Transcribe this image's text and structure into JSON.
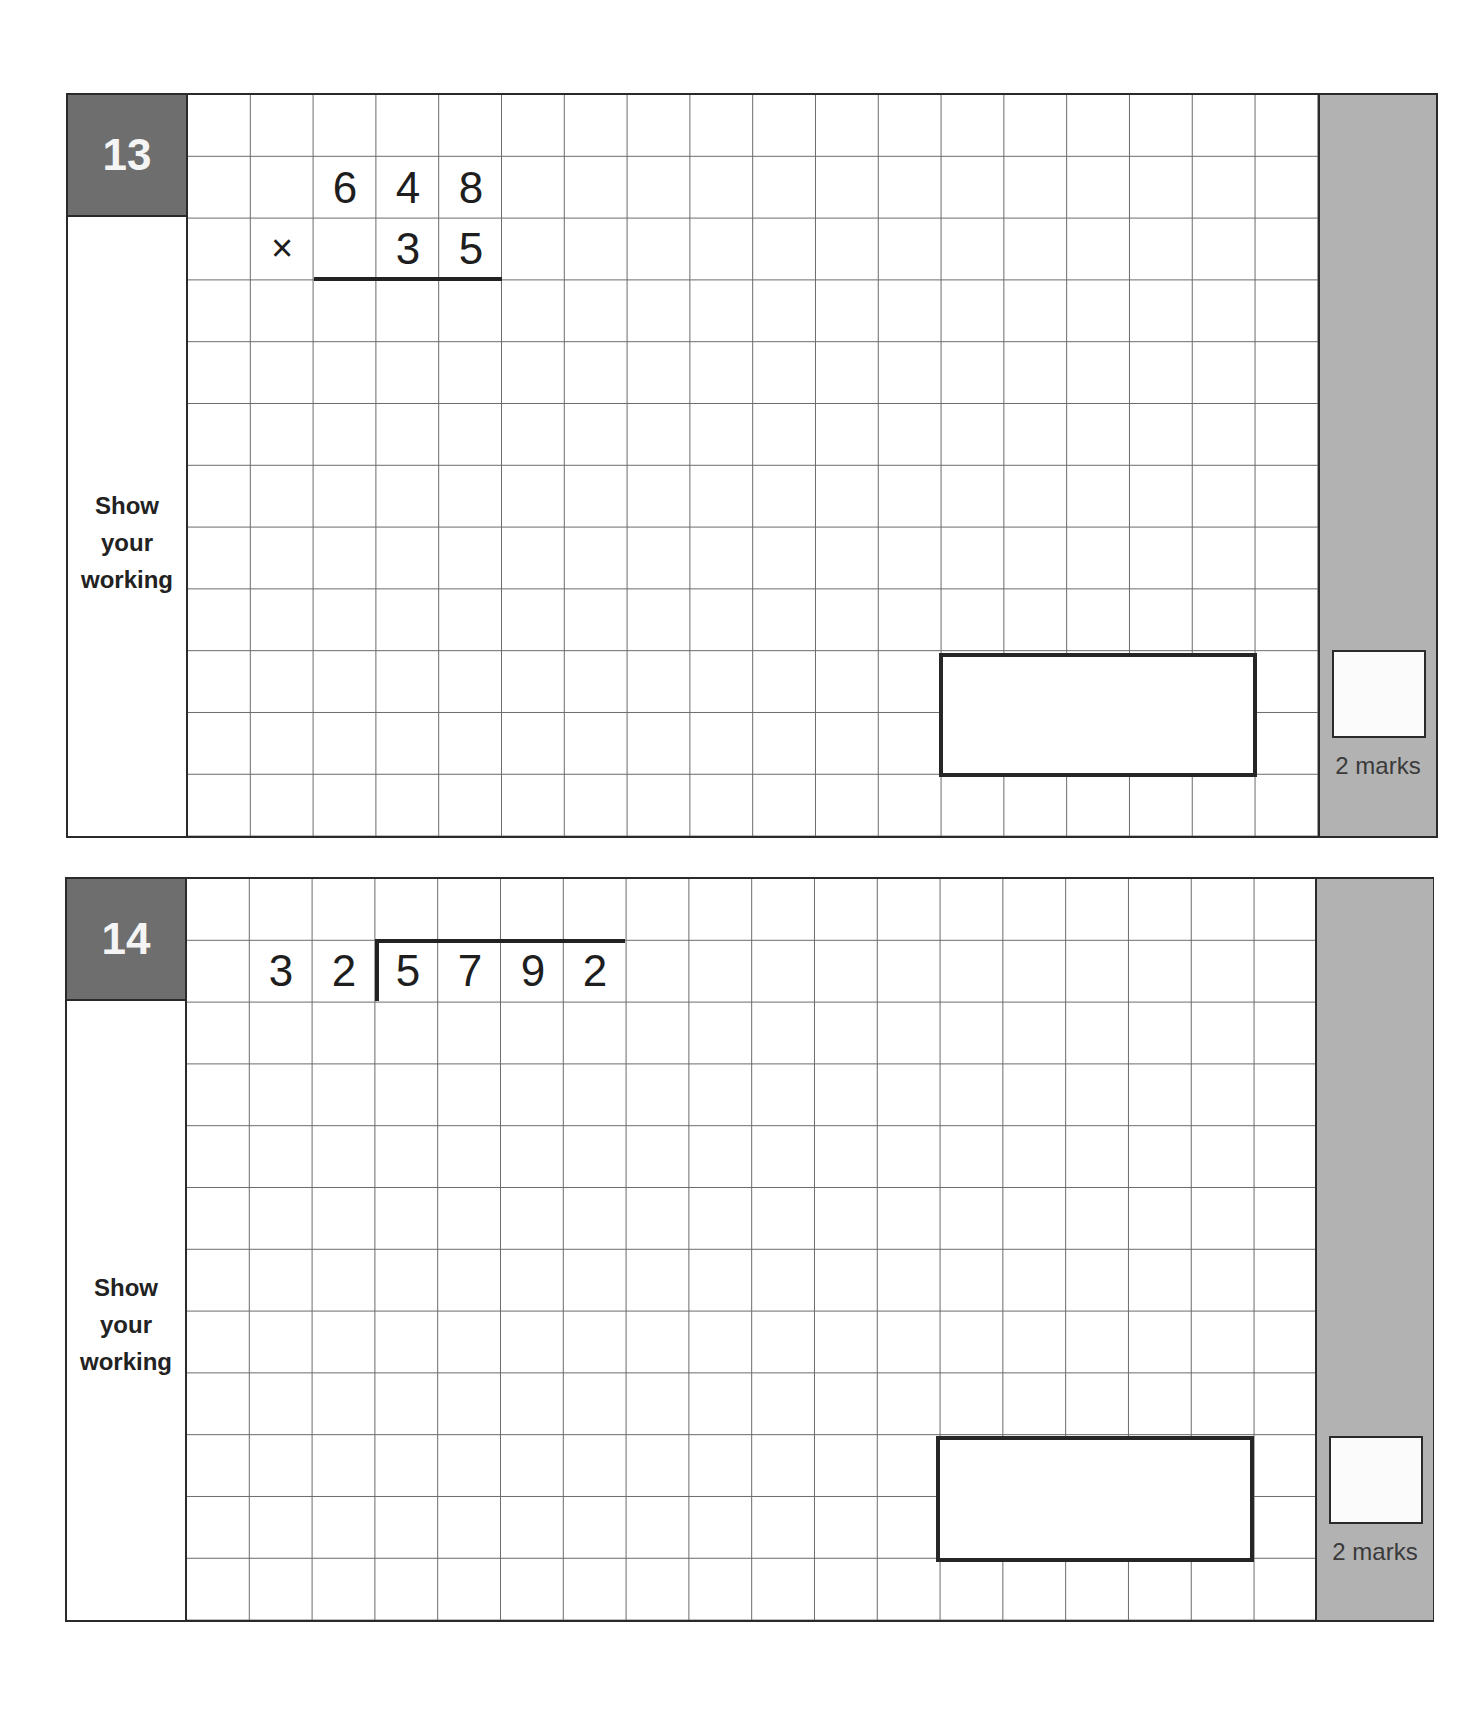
{
  "questions": [
    {
      "number": "13",
      "side_label": [
        "Show",
        "your",
        "working"
      ],
      "problem_type": "long multiplication",
      "top_digits": [
        "6",
        "4",
        "8"
      ],
      "operator": "×",
      "bottom_digits": [
        "3",
        "5"
      ],
      "answer_value": "",
      "marks_label": "2 marks"
    },
    {
      "number": "14",
      "side_label": [
        "Show",
        "your",
        "working"
      ],
      "problem_type": "long division",
      "divisor_digits": [
        "3",
        "2"
      ],
      "dividend_digits": [
        "5",
        "7",
        "9",
        "2"
      ],
      "answer_value": "",
      "marks_label": "2 marks"
    }
  ],
  "colors": {
    "header_bg": "#6e6e6e",
    "marks_bg": "#b2b2b2",
    "border": "#2a2a2a",
    "grid_line": "#6a6a6a"
  }
}
